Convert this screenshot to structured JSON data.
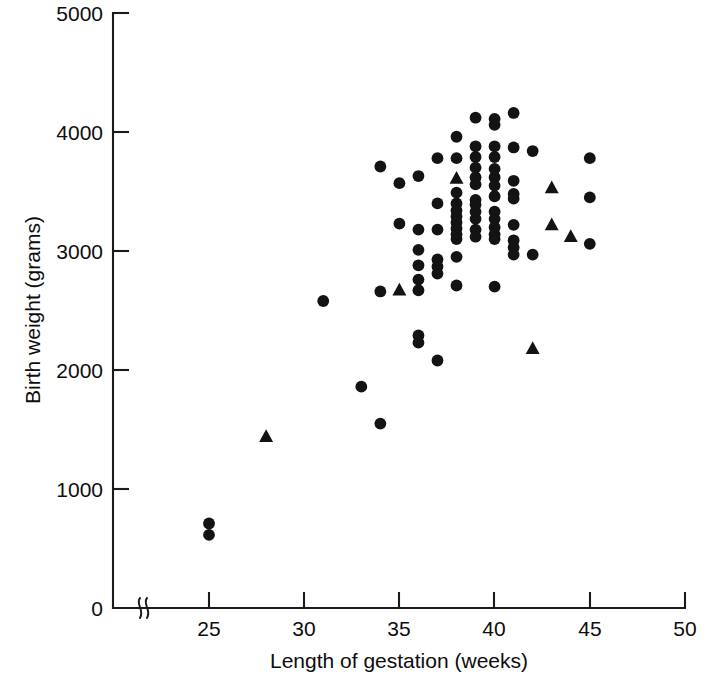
{
  "figure": {
    "background_color": "#ffffff",
    "marker_color": "#131313",
    "axis_color": "#1a1a1a"
  },
  "axes": {
    "x": {
      "title": "Length of gestation (weeks)",
      "ticks": [
        "25",
        "30",
        "35",
        "40",
        "45",
        "50"
      ],
      "tick_values": [
        25,
        30,
        35,
        40,
        45,
        50
      ],
      "range": [
        22,
        50
      ],
      "has_break": true,
      "break_label": "axis-break"
    },
    "y": {
      "title": "Birth weight (grams)",
      "ticks": [
        "0",
        "1000",
        "2000",
        "3000",
        "4000",
        "5000"
      ],
      "tick_values": [
        0,
        1000,
        2000,
        3000,
        4000,
        5000
      ],
      "range": [
        0,
        5000
      ],
      "has_break": true
    }
  },
  "chart_data": {
    "type": "scatter",
    "title": "",
    "xlabel": "Length of gestation (weeks)",
    "ylabel": "Birth weight (grams)",
    "xlim": [
      22,
      50
    ],
    "ylim": [
      0,
      5000
    ],
    "grid": false,
    "legend": "none",
    "series": [
      {
        "name": "circle-marker",
        "marker": "circle",
        "color": "#131313",
        "points": [
          [
            25,
            710
          ],
          [
            25,
            615
          ],
          [
            31,
            2580
          ],
          [
            33,
            1860
          ],
          [
            34,
            1550
          ],
          [
            34,
            3710
          ],
          [
            34,
            2660
          ],
          [
            35,
            3570
          ],
          [
            35,
            3230
          ],
          [
            36,
            3630
          ],
          [
            36,
            3180
          ],
          [
            36,
            3010
          ],
          [
            36,
            2880
          ],
          [
            36,
            2760
          ],
          [
            36,
            2670
          ],
          [
            36,
            2290
          ],
          [
            36,
            2230
          ],
          [
            37,
            3780
          ],
          [
            37,
            3400
          ],
          [
            37,
            3180
          ],
          [
            37,
            2930
          ],
          [
            37,
            2870
          ],
          [
            37,
            2810
          ],
          [
            37,
            2080
          ],
          [
            38,
            3960
          ],
          [
            38,
            3780
          ],
          [
            38,
            3490
          ],
          [
            38,
            3400
          ],
          [
            38,
            3340
          ],
          [
            38,
            3290
          ],
          [
            38,
            3240
          ],
          [
            38,
            3190
          ],
          [
            38,
            3140
          ],
          [
            38,
            3100
          ],
          [
            38,
            2950
          ],
          [
            38,
            2710
          ],
          [
            39,
            4120
          ],
          [
            39,
            3880
          ],
          [
            39,
            3790
          ],
          [
            39,
            3700
          ],
          [
            39,
            3620
          ],
          [
            39,
            3560
          ],
          [
            39,
            3430
          ],
          [
            39,
            3390
          ],
          [
            39,
            3330
          ],
          [
            39,
            3270
          ],
          [
            39,
            3180
          ],
          [
            39,
            3120
          ],
          [
            40,
            4110
          ],
          [
            40,
            4060
          ],
          [
            40,
            3880
          ],
          [
            40,
            3790
          ],
          [
            40,
            3690
          ],
          [
            40,
            3620
          ],
          [
            40,
            3550
          ],
          [
            40,
            3460
          ],
          [
            40,
            3330
          ],
          [
            40,
            3270
          ],
          [
            40,
            3200
          ],
          [
            40,
            3140
          ],
          [
            40,
            3100
          ],
          [
            40,
            2700
          ],
          [
            41,
            4160
          ],
          [
            41,
            3870
          ],
          [
            41,
            3590
          ],
          [
            41,
            3480
          ],
          [
            41,
            3440
          ],
          [
            41,
            3220
          ],
          [
            41,
            3090
          ],
          [
            41,
            3030
          ],
          [
            41,
            2970
          ],
          [
            42,
            3840
          ],
          [
            42,
            2970
          ],
          [
            45,
            3780
          ],
          [
            45,
            3450
          ],
          [
            45,
            3060
          ]
        ]
      },
      {
        "name": "triangle-marker",
        "marker": "triangle",
        "color": "#131313",
        "points": [
          [
            28,
            1440
          ],
          [
            35,
            2670
          ],
          [
            38,
            3610
          ],
          [
            42,
            2180
          ],
          [
            43,
            3530
          ],
          [
            43,
            3220
          ],
          [
            44,
            3120
          ]
        ]
      }
    ]
  }
}
